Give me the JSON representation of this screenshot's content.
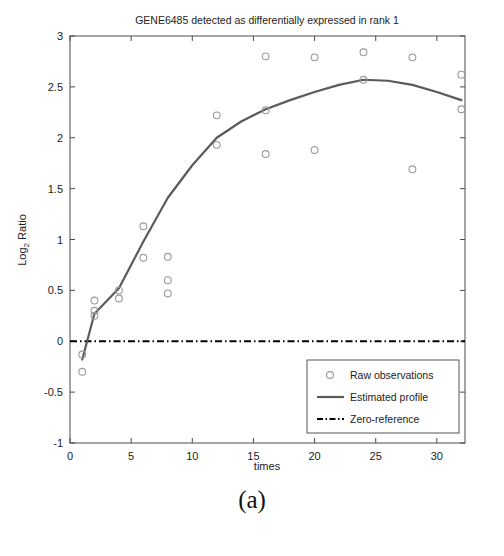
{
  "figure": {
    "caption": "(a)"
  },
  "chart_data": {
    "type": "scatter",
    "title": "GENE6485 detected as differentially expressed in rank 1",
    "xlabel": "times",
    "ylabel": "Log_2 Ratio",
    "ylabel_base": "Log",
    "ylabel_sub": "2",
    "ylabel_rest": " Ratio",
    "xlim": [
      0,
      32.3
    ],
    "ylim": [
      -1,
      3
    ],
    "xticks": [
      0,
      5,
      10,
      15,
      20,
      25,
      30
    ],
    "xticklabels": [
      "0",
      "5",
      "10",
      "15",
      "20",
      "25",
      "30"
    ],
    "yticks": [
      -1,
      -0.5,
      0,
      0.5,
      1,
      1.5,
      2,
      2.5,
      3
    ],
    "yticklabels": [
      "-1",
      "-0.5",
      "0",
      "0.5",
      "1",
      "1.5",
      "2",
      "2.5",
      "3"
    ],
    "grid": false,
    "legend_position": "lower right",
    "series": [
      {
        "name": "Raw observations",
        "type": "scatter",
        "marker": "circle",
        "color": "#9a9a9a",
        "points": [
          {
            "x": 1,
            "y": -0.13
          },
          {
            "x": 1,
            "y": -0.3
          },
          {
            "x": 2,
            "y": 0.4
          },
          {
            "x": 2,
            "y": 0.3
          },
          {
            "x": 2,
            "y": 0.25
          },
          {
            "x": 4,
            "y": 0.5
          },
          {
            "x": 4,
            "y": 0.42
          },
          {
            "x": 6,
            "y": 1.13
          },
          {
            "x": 6,
            "y": 0.82
          },
          {
            "x": 8,
            "y": 0.83
          },
          {
            "x": 8,
            "y": 0.6
          },
          {
            "x": 8,
            "y": 0.47
          },
          {
            "x": 12,
            "y": 2.22
          },
          {
            "x": 12,
            "y": 1.93
          },
          {
            "x": 16,
            "y": 2.8
          },
          {
            "x": 16,
            "y": 2.27
          },
          {
            "x": 16,
            "y": 1.84
          },
          {
            "x": 20,
            "y": 2.79
          },
          {
            "x": 20,
            "y": 1.88
          },
          {
            "x": 24,
            "y": 2.84
          },
          {
            "x": 24,
            "y": 2.57
          },
          {
            "x": 28,
            "y": 2.79
          },
          {
            "x": 28,
            "y": 1.69
          },
          {
            "x": 32,
            "y": 2.62
          },
          {
            "x": 32,
            "y": 2.28
          }
        ]
      },
      {
        "name": "Estimated profile",
        "type": "line",
        "color": "#5a5a5a",
        "points": [
          {
            "x": 1,
            "y": -0.18
          },
          {
            "x": 2,
            "y": 0.27
          },
          {
            "x": 4,
            "y": 0.52
          },
          {
            "x": 6,
            "y": 0.98
          },
          {
            "x": 8,
            "y": 1.41
          },
          {
            "x": 10,
            "y": 1.73
          },
          {
            "x": 12,
            "y": 2.0
          },
          {
            "x": 14,
            "y": 2.16
          },
          {
            "x": 16,
            "y": 2.28
          },
          {
            "x": 18,
            "y": 2.37
          },
          {
            "x": 20,
            "y": 2.45
          },
          {
            "x": 22,
            "y": 2.52
          },
          {
            "x": 24,
            "y": 2.57
          },
          {
            "x": 26,
            "y": 2.56
          },
          {
            "x": 28,
            "y": 2.52
          },
          {
            "x": 30,
            "y": 2.45
          },
          {
            "x": 32,
            "y": 2.37
          }
        ]
      },
      {
        "name": "Zero-reference",
        "type": "line",
        "color": "#000000",
        "style": "dash-dot",
        "yvalue": 0
      }
    ],
    "legend": [
      {
        "label": "Raw observations",
        "kind": "marker"
      },
      {
        "label": "Estimated profile",
        "kind": "line"
      },
      {
        "label": "Zero-reference",
        "kind": "dashdot"
      }
    ]
  }
}
